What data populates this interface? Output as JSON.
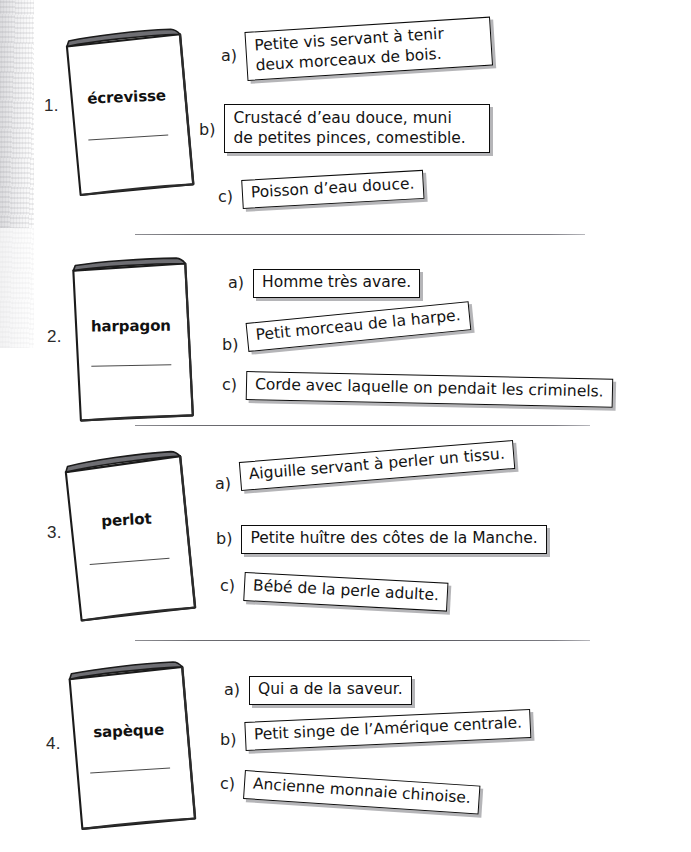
{
  "document": {
    "type": "worksheet",
    "language": "fr",
    "background_color": "#ffffff",
    "ink_color": "#131313",
    "shadow_color": "#78787d"
  },
  "exercises": [
    {
      "number": "1.",
      "word": "écrevisse",
      "answers": [
        {
          "letter": "a)",
          "text": "Petite vis servant à tenir deux morceaux de bois.",
          "line1": "Petite vis servant à tenir",
          "line2": "deux morceaux de bois."
        },
        {
          "letter": "b)",
          "text": "Crustacé d’eau douce, muni de petites pinces, comestible.",
          "line1": "Crustacé d’eau douce, muni",
          "line2": "de petites pinces, comestible."
        },
        {
          "letter": "c)",
          "text": "Poisson d’eau douce."
        }
      ]
    },
    {
      "number": "2.",
      "word": "harpagon",
      "answers": [
        {
          "letter": "a)",
          "text": "Homme très avare."
        },
        {
          "letter": "b)",
          "text": "Petit morceau de la harpe."
        },
        {
          "letter": "c)",
          "text": "Corde avec laquelle on pendait les criminels."
        }
      ]
    },
    {
      "number": "3.",
      "word": "perlot",
      "answers": [
        {
          "letter": "a)",
          "text": "Aiguille servant à perler un tissu."
        },
        {
          "letter": "b)",
          "text": "Petite huître des côtes de la Manche."
        },
        {
          "letter": "c)",
          "text": "Bébé de la perle adulte."
        }
      ]
    },
    {
      "number": "4.",
      "word": "sapèque",
      "answers": [
        {
          "letter": "a)",
          "text": "Qui a de la saveur."
        },
        {
          "letter": "b)",
          "text": "Petit singe de l’Amérique centrale."
        },
        {
          "letter": "c)",
          "text": "Ancienne monnaie chinoise."
        }
      ]
    }
  ]
}
